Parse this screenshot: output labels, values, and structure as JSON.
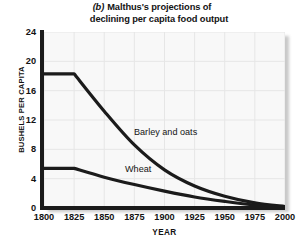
{
  "figure": {
    "panel_letter": "(b)",
    "title_line_1": "Malthus's projections of",
    "title_line_2": "declining per capita food output"
  },
  "chart_data": {
    "type": "line",
    "xlabel": "YEAR",
    "ylabel": "BUSHELS PER CAPITA",
    "xlim": [
      1800,
      2000
    ],
    "ylim": [
      0,
      24
    ],
    "xticks": [
      1800,
      1825,
      1850,
      1875,
      1900,
      1925,
      1950,
      1975,
      2000
    ],
    "yticks": [
      0,
      4,
      8,
      12,
      16,
      20,
      24
    ],
    "grid": true,
    "legend_position": "inline-annotations",
    "series": [
      {
        "name": "Barley and oats",
        "x": [
          1800,
          1825,
          1850,
          1875,
          1900,
          1925,
          1950,
          1975,
          2000
        ],
        "values": [
          18.3,
          18.3,
          13.2,
          8.6,
          5.2,
          3.0,
          1.6,
          0.7,
          0.2
        ]
      },
      {
        "name": "Wheat",
        "x": [
          1800,
          1825,
          1850,
          1875,
          1900,
          1925,
          1950,
          1975,
          2000
        ],
        "values": [
          5.4,
          5.4,
          4.2,
          3.2,
          2.3,
          1.5,
          0.9,
          0.4,
          0.1
        ]
      }
    ],
    "annotations": [
      {
        "text": "Barley and oats",
        "x": 1890,
        "y": 10.8
      },
      {
        "text": "Wheat",
        "x": 1877,
        "y": 5.7
      }
    ],
    "colors": {
      "line": "#1b1b1b",
      "axis": "#1b1b1b",
      "plot_background": "#f8f8f8",
      "grid": "#e6e6e6",
      "page_background": "#ffffff"
    }
  },
  "axes": {
    "y_ticks": [
      {
        "label": "24",
        "value": 24
      },
      {
        "label": "20",
        "value": 20
      },
      {
        "label": "16",
        "value": 16
      },
      {
        "label": "12",
        "value": 12
      },
      {
        "label": "8",
        "value": 8
      },
      {
        "label": "4",
        "value": 4
      },
      {
        "label": "0",
        "value": 0
      }
    ],
    "x_ticks": [
      {
        "label": "1800",
        "value": 1800
      },
      {
        "label": "1825",
        "value": 1825
      },
      {
        "label": "1850",
        "value": 1850
      },
      {
        "label": "1875",
        "value": 1875
      },
      {
        "label": "1900",
        "value": 1900
      },
      {
        "label": "1925",
        "value": 1925
      },
      {
        "label": "1950",
        "value": 1950
      },
      {
        "label": "1975",
        "value": 1975
      },
      {
        "label": "2000",
        "value": 2000
      }
    ],
    "y_title": "BUSHELS PER CAPITA",
    "x_title": "YEAR"
  },
  "series_labels": {
    "barley": "Barley and oats",
    "wheat": "Wheat"
  }
}
